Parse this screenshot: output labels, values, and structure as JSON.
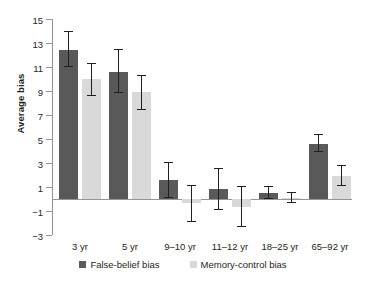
{
  "chart_data": {
    "type": "bar",
    "title": "",
    "xlabel": "",
    "ylabel": "Average bias",
    "ylim": [
      -3,
      15
    ],
    "ytick_labels": [
      "15",
      "13",
      "11",
      "9",
      "7",
      "5",
      "3",
      "1",
      "−1",
      "−3"
    ],
    "yticks": [
      15,
      13,
      11,
      9,
      7,
      5,
      3,
      1,
      -1,
      -3
    ],
    "grid": false,
    "legend_position": "bottom",
    "categories": [
      "3 yr",
      "5 yr",
      "9–10 yr",
      "11–12 yr",
      "18–25 yr",
      "65–92 yr"
    ],
    "series": [
      {
        "name": "False-belief bias",
        "color": "#595959",
        "values": [
          12.4,
          10.6,
          1.6,
          0.8,
          0.5,
          4.6
        ],
        "err_low": [
          11.0,
          8.8,
          0.1,
          -0.9,
          0.0,
          3.9
        ],
        "err_high": [
          14.0,
          12.5,
          3.1,
          2.6,
          1.1,
          5.4
        ]
      },
      {
        "name": "Memory-control bias",
        "color": "#d9d9d9",
        "values": [
          10.0,
          8.9,
          -0.3,
          -0.7,
          0.1,
          1.9
        ],
        "err_low": [
          8.6,
          7.4,
          -1.9,
          -2.3,
          -0.3,
          1.1
        ],
        "err_high": [
          11.3,
          10.3,
          1.2,
          1.1,
          0.6,
          2.8
        ]
      }
    ]
  },
  "legend": {
    "items": [
      {
        "label": "False-belief bias",
        "swatch": "dark-swatch"
      },
      {
        "label": "Memory-control bias",
        "swatch": "light-swatch"
      }
    ]
  },
  "axis": {
    "y_title": "Average bias"
  }
}
